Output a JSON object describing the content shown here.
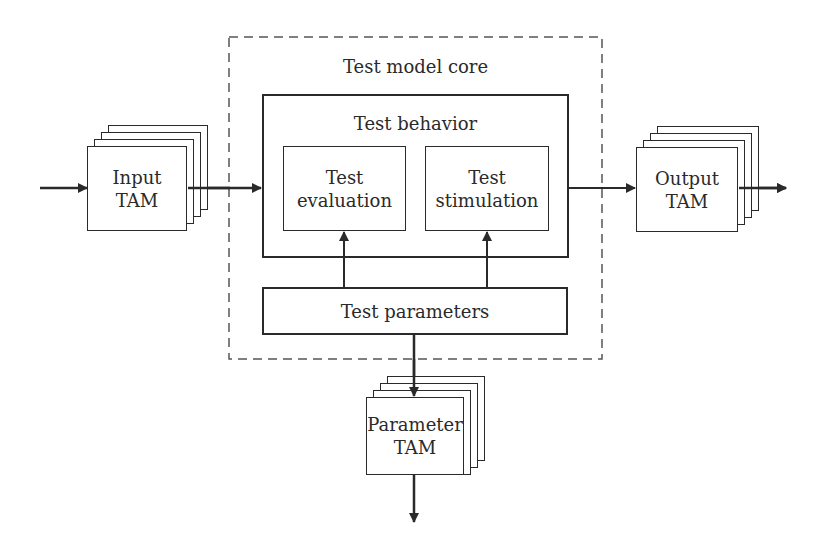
{
  "diagram": {
    "container": {
      "label": "Test model core",
      "style": "dashed"
    },
    "behavior": {
      "label": "Test behavior",
      "children": [
        {
          "id": "evaluation",
          "line1": "Test",
          "line2": "evaluation"
        },
        {
          "id": "stimulation",
          "line1": "Test",
          "line2": "stimulation"
        }
      ]
    },
    "parameters": {
      "label": "Test parameters"
    },
    "input_tam": {
      "line1": "Input",
      "line2": "TAM"
    },
    "output_tam": {
      "line1": "Output",
      "line2": "TAM"
    },
    "parameter_tam": {
      "line1": "Parameter",
      "line2": "TAM"
    },
    "edges": [
      {
        "from": "external",
        "to": "Input TAM"
      },
      {
        "from": "Input TAM",
        "to": "Test behavior"
      },
      {
        "from": "Test behavior",
        "to": "Output TAM"
      },
      {
        "from": "Output TAM",
        "to": "external"
      },
      {
        "from": "Test parameters",
        "to": "Test evaluation"
      },
      {
        "from": "Test parameters",
        "to": "Test stimulation"
      },
      {
        "from": "Test parameters",
        "to": "Parameter TAM"
      },
      {
        "from": "Parameter TAM",
        "to": "external"
      }
    ],
    "colors": {
      "stroke": "#2a2a2a",
      "background": "#ffffff"
    }
  }
}
